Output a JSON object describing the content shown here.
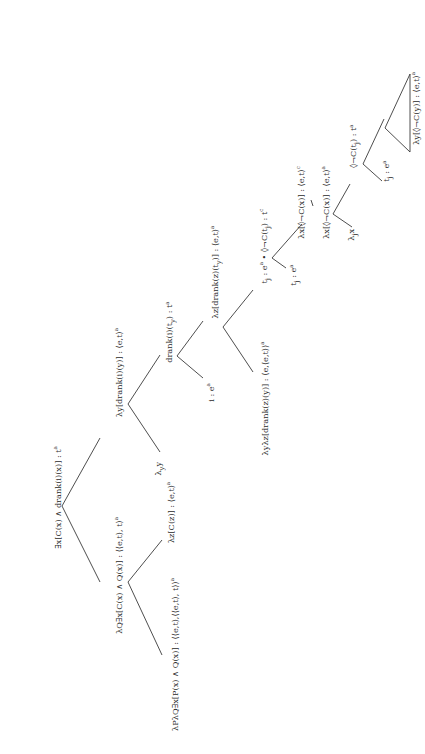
{
  "diagram": {
    "type": "semantic-derivation-tree",
    "orientation": "rotated-90-ccw",
    "line_color": "#3a3a3a",
    "text_color": "#2a2a2a",
    "nodes": {
      "root": {
        "text": "∃x[C(x) ∧ drank(i)(x)] : t",
        "sup": "a",
        "x": 57,
        "y": 497
      },
      "quant": {
        "text": "λQ∃x[C(x) ∧ Q(x)] : ⟨⟨e,t⟩, t⟩",
        "sup": "a",
        "x": 118,
        "y": 575
      },
      "det": {
        "text": "λPλQ∃x[P(x) ∧ Q(x)] : ⟨⟨e,t⟩,⟨⟨e,t⟩, t⟩⟩",
        "sup": "a",
        "x": 174,
        "y": 654
      },
      "noun": {
        "text": "λz[C(z)] : ⟨e,t⟩",
        "sup": "a",
        "x": 170,
        "y": 512
      },
      "vp": {
        "text": "λy[drank(i)(y)] : ⟨e,t⟩",
        "sup": "a",
        "x": 118,
        "y": 372
      },
      "lambda_y": {
        "text": "λ",
        "sub": "y",
        "tail": "y",
        "x": 160,
        "y": 468
      },
      "s1": {
        "text": "drank(i)(t",
        "sub": "y",
        "tail": ") : t",
        "sup": "a",
        "x": 170,
        "y": 332
      },
      "i": {
        "text": "i : e",
        "sup": "a",
        "x": 210,
        "y": 392
      },
      "v1": {
        "text": "λz[drank(z)(t",
        "sub": "y",
        "tail": ")] : ⟨e,t⟩",
        "sup": "a",
        "x": 216,
        "y": 272
      },
      "verb": {
        "text": "λyλz[drank(z)(y)] : ⟨e,⟨e,t⟩⟩",
        "sup": "a",
        "x": 265,
        "y": 398
      },
      "pair": {
        "text": "t",
        "sub": "j",
        "tail": " : e",
        "sup": "a",
        "tail2": " • ◊¬C(t",
        "sub2": "j",
        "tail3": ") : t",
        "sup2": "c",
        "x": 265,
        "y": 246
      },
      "tj1": {
        "text": "t",
        "sub": "j",
        "tail": " : e",
        "sup": "a",
        "x": 295,
        "y": 275
      },
      "rel_c": {
        "text": "λx[◊¬C(x)] : ⟨e,t⟩",
        "sup": "c",
        "x": 300,
        "y": 202
      },
      "rel_a": {
        "text": "λx[◊¬C(x)] : ⟨e,t⟩",
        "sup": "a",
        "x": 325,
        "y": 202
      },
      "lambda_j": {
        "text": "λ",
        "sub": "j",
        "tail": "x",
        "x": 353,
        "y": 234
      },
      "s2": {
        "text": "◊¬C(t",
        "sub": "j",
        "tail": ") : t",
        "sup": "a",
        "x": 355,
        "y": 146
      },
      "tj2": {
        "text": "t",
        "sub": "j",
        "tail": " : e",
        "sup": "a",
        "x": 388,
        "y": 171
      },
      "pred": {
        "text": "λy[◊¬C(y)] : ⟨e,t⟩",
        "sup": "a",
        "x": 415,
        "y": 108
      }
    },
    "edges": [
      [
        62,
        506,
        100,
        438
      ],
      [
        62,
        506,
        100,
        582
      ],
      [
        128,
        582,
        162,
        540
      ],
      [
        128,
        582,
        162,
        655
      ],
      [
        128,
        404,
        160,
        355
      ],
      [
        128,
        404,
        160,
        452
      ],
      [
        177,
        356,
        203,
        321
      ],
      [
        177,
        356,
        203,
        378
      ],
      [
        223,
        327,
        253,
        290
      ],
      [
        223,
        327,
        253,
        372
      ],
      [
        272,
        258,
        302,
        224
      ],
      [
        272,
        258,
        286,
        268
      ],
      [
        311,
        200,
        313,
        206
      ],
      [
        333,
        214,
        350,
        184
      ],
      [
        333,
        214,
        352,
        227
      ],
      [
        363,
        164,
        384,
        119
      ],
      [
        363,
        164,
        382,
        181
      ],
      [
        385,
        128,
        410,
        74
      ],
      [
        385,
        128,
        410,
        152
      ],
      [
        410,
        74,
        410,
        152
      ]
    ]
  }
}
